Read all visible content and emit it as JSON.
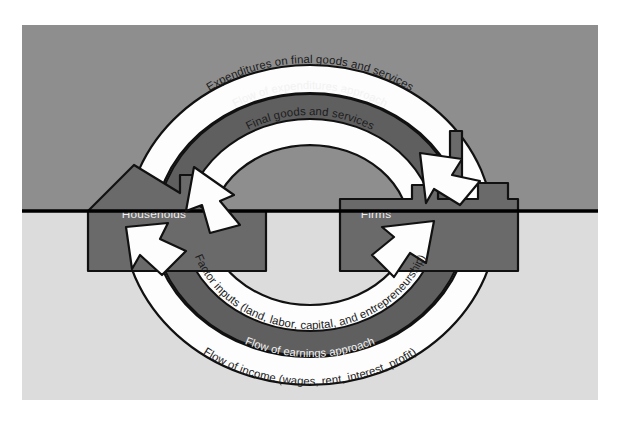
{
  "figure": {
    "type": "circular-flow-diagram",
    "background": {
      "page": "#ffffff",
      "upper_half": "#8e8e8e",
      "lower_half": "#dcdcdc",
      "divider_line": "#000000"
    },
    "palette": {
      "arrow_fill": "#fdfdfd",
      "arrow_stroke": "#111111",
      "band_fill": "#5f5f5f",
      "band_stroke": "#111111",
      "node_fill": "#6a6a6a",
      "node_stroke": "#111111",
      "band_text": "#f2f2f2",
      "arc_text": "#1c1c1c",
      "node_text": "#efefef"
    }
  },
  "nodes": [
    {
      "id": "households",
      "label": "Households",
      "icon": "house-icon",
      "side": "left"
    },
    {
      "id": "firms",
      "label": "Firms",
      "icon": "factory-icon",
      "side": "right"
    }
  ],
  "flows": {
    "upper": {
      "direction": "households-to-firms",
      "outer_label": "Expenditures on final goods and services",
      "band_label": "Flow of expenditures approach",
      "inner_label": "Final goods and services"
    },
    "lower": {
      "direction": "firms-to-households",
      "outer_label": "Flow of income (wages, rent, interest, profit)",
      "band_label": "Flow of earnings approach",
      "inner_label": "Factor inputs (land, labor, capital, and entrepreneurship)"
    }
  },
  "arrowheads": [
    {
      "id": "arrow-into-households-upper",
      "target": "households",
      "points": "down-left"
    },
    {
      "id": "arrow-into-firms-upper",
      "target": "firms",
      "points": "down-right"
    },
    {
      "id": "arrow-into-households-lower",
      "target": "households",
      "points": "up-left"
    },
    {
      "id": "arrow-into-firms-lower",
      "target": "firms",
      "points": "up-right"
    }
  ]
}
